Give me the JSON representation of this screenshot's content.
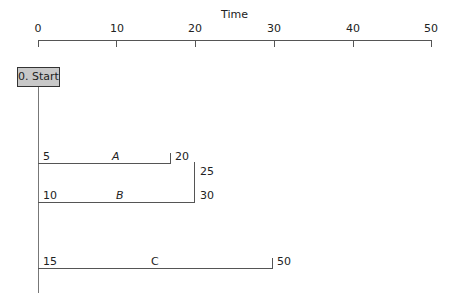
{
  "axis": {
    "title": "Time",
    "ticks": [
      "0",
      "10",
      "20",
      "30",
      "40",
      "50"
    ]
  },
  "start": {
    "label": "0. Start"
  },
  "activities": [
    {
      "name": "A",
      "start_label": "5",
      "end_label": "20"
    },
    {
      "name": "B",
      "start_label": "10",
      "end_label": "30",
      "extra_label": "25"
    },
    {
      "name": "C",
      "start_label": "15",
      "end_label": "50"
    }
  ]
}
